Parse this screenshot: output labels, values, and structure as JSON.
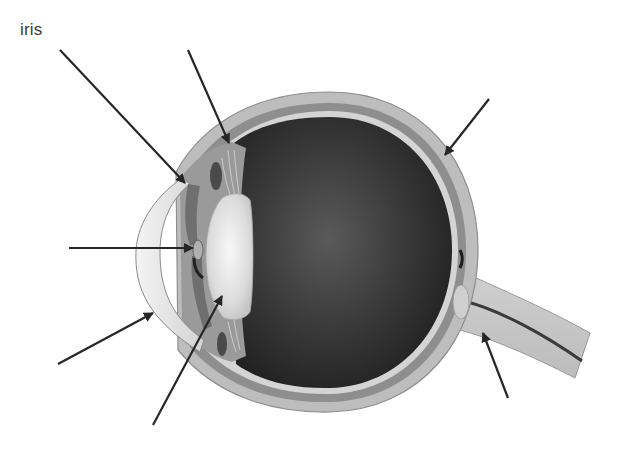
{
  "diagram": {
    "labels": [
      {
        "id": "iris",
        "text": "iris",
        "x": 20,
        "y": 20
      }
    ],
    "arrows": [
      {
        "name": "arrow-iris",
        "target": "iris",
        "x1": 60,
        "y1": 50,
        "x2": 185,
        "y2": 183,
        "labeled": true
      },
      {
        "name": "arrow-ciliary-body",
        "target": "ciliary body",
        "x1": 188,
        "y1": 50,
        "x2": 229,
        "y2": 143,
        "labeled": false
      },
      {
        "name": "arrow-retina",
        "target": "retina / sclera",
        "x1": 489,
        "y1": 99,
        "x2": 445,
        "y2": 155,
        "labeled": false
      },
      {
        "name": "arrow-pupil",
        "target": "pupil",
        "x1": 69,
        "y1": 248,
        "x2": 193,
        "y2": 248,
        "labeled": false
      },
      {
        "name": "arrow-cornea",
        "target": "cornea",
        "x1": 58,
        "y1": 364,
        "x2": 153,
        "y2": 313,
        "labeled": false
      },
      {
        "name": "arrow-lens",
        "target": "lens",
        "x1": 153,
        "y1": 425,
        "x2": 222,
        "y2": 296,
        "labeled": false
      },
      {
        "name": "arrow-optic-nerve",
        "target": "optic nerve",
        "x1": 508,
        "y1": 398,
        "x2": 483,
        "y2": 333,
        "labeled": false
      }
    ],
    "colors": {
      "background": "#ffffff",
      "arrow": "#262626",
      "label": "#3a3a3a",
      "sclera": "#b9b9b9",
      "choroid": "#8c8c8c",
      "retina_light": "#d6d6d6",
      "vitreous_dark": "#2a2a2a",
      "lens": "#e8e8e8",
      "cornea": "#ececec"
    }
  }
}
